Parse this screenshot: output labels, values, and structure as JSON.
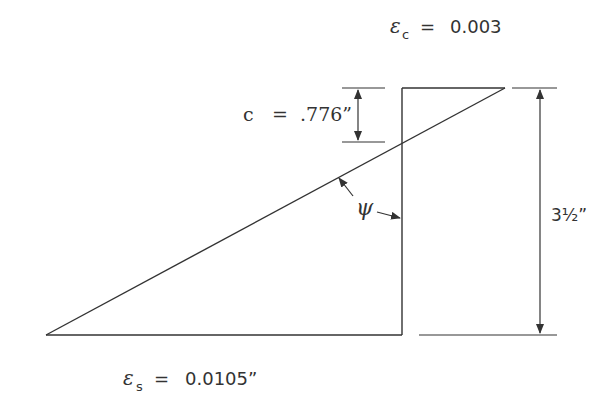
{
  "diagram": {
    "type": "strain-diagram",
    "labels": {
      "epsilon_c": {
        "symbol": "ε",
        "sub": "c",
        "eq": "=",
        "value": "0.003"
      },
      "epsilon_s": {
        "symbol": "ε",
        "sub": "s",
        "eq": "=",
        "value": "0.0105”"
      },
      "c_depth": {
        "symbol": "c",
        "eq": "=",
        "value": ".776”"
      },
      "angle": {
        "symbol": "ψ"
      },
      "height": {
        "value": "3½”"
      }
    },
    "colors": {
      "line": "#333333",
      "background": "#ffffff"
    }
  }
}
